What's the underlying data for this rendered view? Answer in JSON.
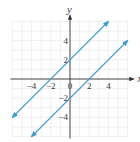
{
  "chart_data": {
    "type": "line",
    "title": "",
    "xlabel": "x",
    "ylabel": "y",
    "xlim": [
      -6,
      6
    ],
    "ylim": [
      -6,
      6
    ],
    "grid": true,
    "x_ticks": [
      -4,
      -2,
      0,
      2,
      4
    ],
    "x_tick_labels": [
      "−4",
      "−2",
      "0",
      "2",
      "4"
    ],
    "y_ticks": [
      4,
      2,
      -2,
      -4
    ],
    "y_tick_labels": [
      "4",
      "2",
      "−2",
      "−4"
    ],
    "series": [
      {
        "name": "y = x + 2",
        "x": [
          -6,
          4
        ],
        "y": [
          -4,
          6
        ],
        "color": "#3b9ccf",
        "arrows": "both"
      },
      {
        "name": "y = x − 2",
        "x": [
          -4,
          6
        ],
        "y": [
          -6,
          4
        ],
        "color": "#3b9ccf",
        "arrows": "both"
      }
    ]
  },
  "colors": {
    "line": "#3b9ccf",
    "axis": "#333333",
    "grid": "#cfcfcf"
  }
}
